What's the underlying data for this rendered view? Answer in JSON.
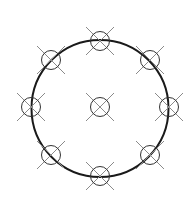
{
  "diagram": {
    "type": "bolt-circle",
    "background": "#ffffff",
    "main_circle": {
      "cx": 100,
      "cy": 108.5,
      "r": 68.5,
      "stroke": "#1a1a1a",
      "stroke_width": 2
    },
    "marker_style": {
      "r": 9.5,
      "arm": 14,
      "circle_stroke": "#333333",
      "cross_stroke": "#8a8a8a",
      "circle_width": 1,
      "cross_width": 1
    },
    "markers": [
      {
        "name": "marker-center",
        "cx": 100,
        "cy": 107
      },
      {
        "name": "marker-top",
        "cx": 100,
        "cy": 41
      },
      {
        "name": "marker-top-right",
        "cx": 150,
        "cy": 60
      },
      {
        "name": "marker-right",
        "cx": 169,
        "cy": 107
      },
      {
        "name": "marker-bottom-right",
        "cx": 150,
        "cy": 155
      },
      {
        "name": "marker-bottom",
        "cx": 100,
        "cy": 176
      },
      {
        "name": "marker-bottom-left",
        "cx": 51,
        "cy": 155
      },
      {
        "name": "marker-left",
        "cx": 31,
        "cy": 107
      },
      {
        "name": "marker-top-left",
        "cx": 51,
        "cy": 60
      }
    ]
  }
}
